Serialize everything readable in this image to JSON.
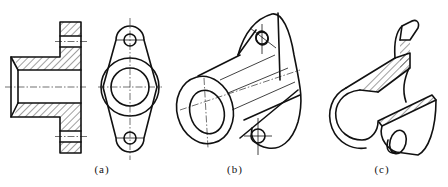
{
  "figure": {
    "panels": [
      {
        "id": "a",
        "label": "(a)",
        "content": "sectioned side view and front view of flanged bushing"
      },
      {
        "id": "b",
        "label": "(b)",
        "content": "isometric view of flanged bushing"
      },
      {
        "id": "c",
        "label": "(c)",
        "content": "isometric cutaway (half-section) view"
      }
    ]
  }
}
